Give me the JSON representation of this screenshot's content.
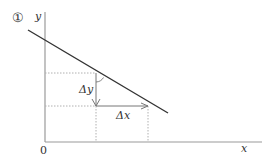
{
  "figure": {
    "number_label": "①",
    "y_axis_label": "y",
    "x_axis_label": "x",
    "origin_label": "0",
    "delta_y_label": "Δy",
    "delta_x_label": "Δx"
  },
  "colors": {
    "axis": "#999999",
    "line": "#333333",
    "dotted": "#aaaaaa",
    "text": "#333333"
  }
}
